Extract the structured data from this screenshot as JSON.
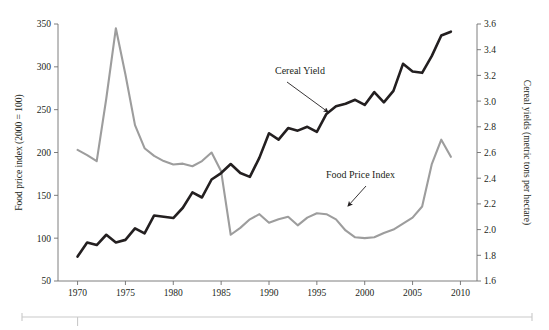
{
  "chart_data": {
    "type": "line",
    "title": "",
    "subtitle": "",
    "xlabel": "",
    "ylabel": "Food price index (2000 = 100)",
    "y2label": "Cereal yields (metric tons per hectare)",
    "grid": false,
    "legend_position": "inline-annotations",
    "xlim": [
      1969,
      2011
    ],
    "ylim": [
      50,
      350
    ],
    "y2lim": [
      1.6,
      3.6
    ],
    "xticks": [
      1970,
      1975,
      1980,
      1985,
      1990,
      1995,
      2000,
      2005,
      2010
    ],
    "xtick_labels": [
      "1970",
      "1975",
      "1980",
      "1985",
      "1990",
      "1995",
      "2000",
      "2005",
      "2010"
    ],
    "yticks": [
      50,
      100,
      150,
      200,
      250,
      300,
      350
    ],
    "ytick_labels": [
      "50",
      "100",
      "150",
      "200",
      "250",
      "300",
      "350"
    ],
    "y2ticks": [
      1.6,
      1.8,
      2.0,
      2.2,
      2.4,
      2.6,
      2.8,
      3.0,
      3.2,
      3.4,
      3.6
    ],
    "y2tick_labels": [
      "1.6",
      "1.8",
      "2.0",
      "2.2",
      "2.4",
      "2.6",
      "2.8",
      "3.0",
      "3.2",
      "3.4",
      "3.6"
    ],
    "x": [
      1970,
      1971,
      1972,
      1973,
      1974,
      1975,
      1976,
      1977,
      1978,
      1979,
      1980,
      1981,
      1982,
      1983,
      1984,
      1985,
      1986,
      1987,
      1988,
      1989,
      1990,
      1991,
      1992,
      1993,
      1994,
      1995,
      1996,
      1997,
      1998,
      1999,
      2000,
      2001,
      2002,
      2003,
      2004,
      2005,
      2006,
      2007,
      2008,
      2009
    ],
    "series": [
      {
        "name": "Food Price Index",
        "axis": "left",
        "color": "#9d9d9d",
        "units": "index (2000 = 100)",
        "values": [
          203,
          197,
          190,
          263,
          345,
          291,
          232,
          205,
          196,
          190,
          186,
          187,
          184,
          190,
          200,
          178,
          104,
          112,
          122,
          128,
          118,
          122,
          125,
          115,
          124,
          129,
          128,
          122,
          109,
          101,
          100,
          101,
          106,
          110,
          117,
          124,
          137,
          186,
          215,
          195
        ]
      },
      {
        "name": "Cereal Yield",
        "axis": "right",
        "color": "#231f20",
        "units": "metric tons per hectare",
        "values": [
          1.79,
          1.9,
          1.88,
          1.96,
          1.9,
          1.92,
          2.01,
          1.97,
          2.11,
          2.1,
          2.09,
          2.17,
          2.29,
          2.25,
          2.39,
          2.44,
          2.51,
          2.44,
          2.41,
          2.56,
          2.75,
          2.7,
          2.79,
          2.77,
          2.8,
          2.76,
          2.9,
          2.96,
          2.98,
          3.01,
          2.97,
          3.07,
          2.99,
          3.08,
          3.29,
          3.23,
          3.22,
          3.35,
          3.51,
          3.54
        ]
      }
    ],
    "annotations": [
      {
        "name": "cereal-yield-annotation",
        "text": "Cereal Yield",
        "text_x": 275,
        "text_y": 74,
        "arrow_from_x": 287,
        "arrow_from_y": 82,
        "arrow_to_x": 328,
        "arrow_to_y": 112
      },
      {
        "name": "food-price-index-annotation",
        "text": "Food Price Index",
        "text_x": 326,
        "text_y": 178,
        "arrow_from_x": 366,
        "arrow_from_y": 186,
        "arrow_to_x": 348,
        "arrow_to_y": 206
      }
    ]
  },
  "axes": {
    "left": {
      "title": "Food price index (2000 = 100)"
    },
    "right": {
      "title": "Cereal yields (metric tons per hectare)"
    }
  }
}
